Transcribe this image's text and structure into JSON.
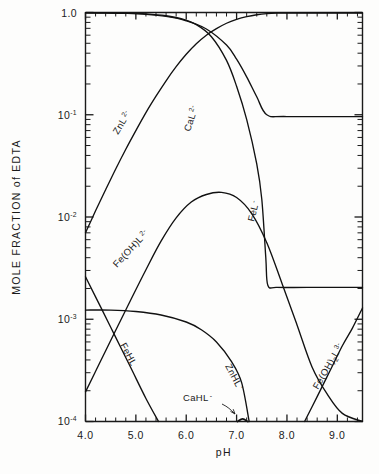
{
  "chart_data": {
    "type": "line",
    "title": "",
    "xlabel": "pH",
    "ylabel": "MOLE FRACTION of EDTA",
    "xlim": [
      4.0,
      9.5
    ],
    "ylim": [
      0.0001,
      1.0
    ],
    "yscale": "log",
    "xscale": "linear",
    "grid": false,
    "legend": "inline-curve-labels",
    "xticks": [
      4.0,
      5.0,
      6.0,
      7.0,
      8.0,
      9.0
    ],
    "xticklabels": [
      "4.0",
      "5.0",
      "6.0",
      "7.0",
      "8.0",
      "9.0"
    ],
    "yticks": [
      1.0,
      0.1,
      0.01,
      0.001,
      0.0001
    ],
    "yticklabels": [
      "1.0",
      "10-1",
      "10-2",
      "10-3",
      "10-4"
    ],
    "series": [
      {
        "name": "ZnL 2-",
        "label_base": "ZnL",
        "label_sup": "2-",
        "points": [
          [
            4.0,
            0.007
          ],
          [
            4.2,
            0.0115
          ],
          [
            4.4,
            0.0185
          ],
          [
            4.6,
            0.0295
          ],
          [
            4.8,
            0.046
          ],
          [
            5.0,
            0.07
          ],
          [
            5.2,
            0.105
          ],
          [
            5.4,
            0.152
          ],
          [
            5.6,
            0.215
          ],
          [
            5.8,
            0.295
          ],
          [
            6.0,
            0.39
          ],
          [
            6.2,
            0.495
          ],
          [
            6.4,
            0.6
          ],
          [
            6.6,
            0.695
          ],
          [
            6.8,
            0.785
          ],
          [
            7.0,
            0.855
          ],
          [
            7.2,
            0.91
          ],
          [
            7.4,
            0.95
          ],
          [
            7.6,
            0.975
          ],
          [
            7.8,
            0.985
          ],
          [
            8.2,
            0.988
          ],
          [
            9.5,
            0.988
          ]
        ]
      },
      {
        "name": "CaL 2-",
        "label_base": "CaL",
        "label_sup": "2-",
        "points": [
          [
            4.0,
            0.99
          ],
          [
            4.4,
            0.988
          ],
          [
            4.8,
            0.98
          ],
          [
            5.2,
            0.96
          ],
          [
            5.6,
            0.915
          ],
          [
            6.0,
            0.83
          ],
          [
            6.4,
            0.69
          ],
          [
            6.8,
            0.48
          ],
          [
            7.0,
            0.35
          ],
          [
            7.2,
            0.235
          ],
          [
            7.4,
            0.15
          ],
          [
            7.6,
            0.1
          ],
          [
            8.0,
            0.096
          ],
          [
            9.5,
            0.096
          ]
        ]
      },
      {
        "name": "FeL -",
        "label_base": "FeL",
        "label_sup": "-",
        "points": [
          [
            4.0,
            0.995
          ],
          [
            4.4,
            0.993
          ],
          [
            4.8,
            0.986
          ],
          [
            5.2,
            0.97
          ],
          [
            5.6,
            0.93
          ],
          [
            5.9,
            0.87
          ],
          [
            6.2,
            0.76
          ],
          [
            6.5,
            0.58
          ],
          [
            6.8,
            0.34
          ],
          [
            7.0,
            0.19
          ],
          [
            7.2,
            0.09
          ],
          [
            7.4,
            0.033
          ],
          [
            7.5,
            0.015
          ],
          [
            7.58,
            0.004
          ],
          [
            7.62,
            0.00215
          ],
          [
            7.8,
            0.00205
          ],
          [
            8.4,
            0.00205
          ],
          [
            9.5,
            0.00205
          ]
        ]
      },
      {
        "name": "Fe(OH)L 2-",
        "label_base": "Fe(OH)L",
        "label_sup": "2-",
        "points": [
          [
            4.0,
            0.000195
          ],
          [
            4.3,
            0.00039
          ],
          [
            4.6,
            0.00078
          ],
          [
            4.9,
            0.00155
          ],
          [
            5.2,
            0.00305
          ],
          [
            5.5,
            0.0058
          ],
          [
            5.8,
            0.0098
          ],
          [
            6.1,
            0.014
          ],
          [
            6.4,
            0.0166
          ],
          [
            6.7,
            0.0174
          ],
          [
            7.0,
            0.0155
          ],
          [
            7.3,
            0.0108
          ],
          [
            7.6,
            0.0056
          ],
          [
            7.9,
            0.00225
          ],
          [
            8.2,
            0.00088
          ],
          [
            8.5,
            0.00034
          ],
          [
            8.8,
            0.000185
          ],
          [
            9.1,
            0.00012
          ],
          [
            9.5,
            9.65e-05
          ]
        ]
      },
      {
        "name": "FeHL",
        "label_base": "FeHL",
        "label_sup": "",
        "points": [
          [
            4.0,
            0.0026
          ],
          [
            4.3,
            0.00132
          ],
          [
            4.6,
            0.000665
          ],
          [
            4.9,
            0.000335
          ],
          [
            5.2,
            0.000168
          ],
          [
            5.45,
            9.85e-05
          ]
        ]
      },
      {
        "name": "ZnHL -",
        "label_base": "ZnHL",
        "label_sup": "-",
        "points": [
          [
            4.0,
            0.00123
          ],
          [
            4.5,
            0.00123
          ],
          [
            5.0,
            0.00119
          ],
          [
            5.5,
            0.0011
          ],
          [
            6.0,
            0.00094
          ],
          [
            6.3,
            0.00079
          ],
          [
            6.6,
            0.0006
          ],
          [
            6.9,
            0.000385
          ],
          [
            7.1,
            0.00024
          ],
          [
            7.25,
            9.85e-05
          ]
        ]
      },
      {
        "name": "CaHL -",
        "label_base": "CaHL",
        "label_sup": "-",
        "points": [
          [
            7.02,
            9.8e-05
          ],
          [
            7.12,
            0.000106
          ],
          [
            7.22,
            9.8e-05
          ]
        ]
      },
      {
        "name": "Fe(OH)2L 3-",
        "label_base": "Fe(OH)",
        "label_sub": "2",
        "label_base2": "L",
        "label_sup": "3-",
        "points": [
          [
            8.35,
            9.85e-05
          ],
          [
            8.6,
            0.000175
          ],
          [
            8.85,
            0.00031
          ],
          [
            9.1,
            0.00055
          ],
          [
            9.3,
            0.00082
          ],
          [
            9.5,
            0.00129
          ]
        ]
      }
    ],
    "annotations": [
      {
        "text": "CaHL-",
        "note": "arrow pointing to small peak near pH 7.1 at baseline"
      }
    ]
  },
  "axis": {
    "y_title": "MOLE FRACTION of EDTA",
    "x_title": "pH",
    "y_labels": [
      {
        "mantissa": "1.0",
        "exp": ""
      },
      {
        "mantissa": "10",
        "exp": "-1"
      },
      {
        "mantissa": "10",
        "exp": "-2"
      },
      {
        "mantissa": "10",
        "exp": "-3"
      },
      {
        "mantissa": "10",
        "exp": "-4"
      }
    ],
    "x_labels": [
      "4.0",
      "5.0",
      "6.0",
      "7.0",
      "8.0",
      "9.0"
    ]
  },
  "curve_labels": [
    {
      "id": "znl",
      "base": "ZnL",
      "sup": "2-"
    },
    {
      "id": "cal",
      "base": "CaL",
      "sup": "2-"
    },
    {
      "id": "fel",
      "base": "FeL",
      "sup": "-"
    },
    {
      "id": "feohl",
      "base": "Fe(OH)L",
      "sup": "2-"
    },
    {
      "id": "fehl",
      "base": "FeHL",
      "sup": ""
    },
    {
      "id": "znhl",
      "base": "ZnHL",
      "sup": "-"
    },
    {
      "id": "cahl",
      "base": "CaHL",
      "sup": "-"
    },
    {
      "id": "feoh2l",
      "base": "Fe(OH)",
      "sub": "2",
      "base2": "L",
      "sup": "3-"
    }
  ],
  "colors": {
    "ink": "#111111",
    "background": "#fdfdfc"
  }
}
